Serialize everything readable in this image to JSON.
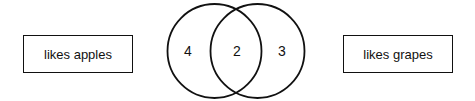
{
  "diagram": {
    "type": "venn",
    "sets": [
      {
        "id": "A",
        "label": "likes apples",
        "only_count": "4"
      },
      {
        "id": "B",
        "label": "likes grapes",
        "only_count": "3"
      }
    ],
    "intersection": {
      "sets": [
        "A",
        "B"
      ],
      "count": "2"
    },
    "colors": {
      "stroke": "#111111",
      "background": "#ffffff"
    }
  }
}
